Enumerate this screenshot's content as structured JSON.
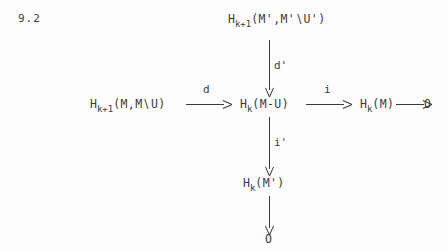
{
  "page": {
    "label": "9.2",
    "background_color": "#fdfdfd",
    "ink_color": "#3b3b3b"
  },
  "diagram": {
    "type": "commutative-diagram",
    "nodes": [
      {
        "id": "top",
        "text": "H_{k+1}(M',M'\\U')",
        "head": "H",
        "sub": "k+1",
        "args": "(M',M'∖U')"
      },
      {
        "id": "left",
        "text": "H_{k+1}(M,M\\U)",
        "head": "H",
        "sub": "k+1",
        "args": "(M,M∖U)"
      },
      {
        "id": "center",
        "text": "H_k(M-U)",
        "head": "H",
        "sub": "k",
        "args": "(M-U)"
      },
      {
        "id": "right",
        "text": "H_k(M)",
        "head": "H",
        "sub": "k",
        "args": "(M)"
      },
      {
        "id": "far-right",
        "text": "O",
        "head": "O",
        "sub": "",
        "args": ""
      },
      {
        "id": "bottom",
        "text": "H_k(M')",
        "head": "H",
        "sub": "k",
        "args": "(M')"
      },
      {
        "id": "bottom-zero",
        "text": "O",
        "head": "O",
        "sub": "",
        "args": ""
      }
    ],
    "arrows": [
      {
        "id": "top-to-center",
        "label": "d'",
        "direction": "down"
      },
      {
        "id": "left-to-center",
        "label": "d",
        "direction": "right"
      },
      {
        "id": "center-to-right",
        "label": "i",
        "direction": "right"
      },
      {
        "id": "right-to-zero",
        "label": "",
        "direction": "right"
      },
      {
        "id": "center-to-bottom",
        "label": "i'",
        "direction": "down"
      },
      {
        "id": "bottom-to-zero",
        "label": "",
        "direction": "down"
      }
    ]
  }
}
